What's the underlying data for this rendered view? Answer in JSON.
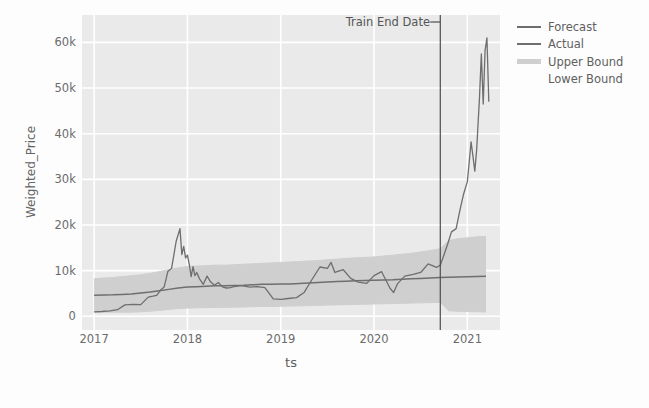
{
  "chart_data": {
    "type": "line",
    "title": "",
    "xlabel": "ts",
    "ylabel": "Weighted_Price",
    "grid": true,
    "legend_position": "right",
    "xlim": [
      2016.87,
      2021.35
    ],
    "ylim": [
      -3000,
      66000
    ],
    "xticks": [
      {
        "label": "2017",
        "value": 2017
      },
      {
        "label": "2018",
        "value": 2018
      },
      {
        "label": "2019",
        "value": 2019
      },
      {
        "label": "2020",
        "value": 2020
      },
      {
        "label": "2021",
        "value": 2021
      }
    ],
    "yticks": [
      {
        "label": "0",
        "value": 0
      },
      {
        "label": "10k",
        "value": 10000
      },
      {
        "label": "20k",
        "value": 20000
      },
      {
        "label": "30k",
        "value": 30000
      },
      {
        "label": "40k",
        "value": 40000
      },
      {
        "label": "50k",
        "value": 50000
      },
      {
        "label": "60k",
        "value": 60000
      }
    ],
    "annotations": [
      {
        "label": "Train End Date",
        "type": "vline",
        "x": 2020.71
      }
    ],
    "legend": [
      {
        "label": "Forecast",
        "color": "#6e6e6e",
        "style": "line"
      },
      {
        "label": "Actual",
        "color": "#6e6e6e",
        "style": "line"
      },
      {
        "label": "Upper Bound",
        "color": "#cfcfcf",
        "style": "band"
      },
      {
        "label": "Lower Bound",
        "color": "#e8e8e8",
        "style": "band"
      }
    ],
    "series": [
      {
        "name": "Actual",
        "color": "#6e6e6e",
        "x": [
          2017.0,
          2017.08,
          2017.17,
          2017.25,
          2017.33,
          2017.42,
          2017.5,
          2017.58,
          2017.63,
          2017.67,
          2017.71,
          2017.75,
          2017.79,
          2017.83,
          2017.88,
          2017.92,
          2017.94,
          2017.96,
          2017.98,
          2018.0,
          2018.02,
          2018.04,
          2018.06,
          2018.08,
          2018.1,
          2018.13,
          2018.17,
          2018.21,
          2018.25,
          2018.29,
          2018.33,
          2018.38,
          2018.42,
          2018.46,
          2018.5,
          2018.58,
          2018.67,
          2018.75,
          2018.83,
          2018.92,
          2019.0,
          2019.08,
          2019.17,
          2019.25,
          2019.33,
          2019.42,
          2019.5,
          2019.54,
          2019.58,
          2019.67,
          2019.75,
          2019.83,
          2019.92,
          2020.0,
          2020.08,
          2020.17,
          2020.21,
          2020.25,
          2020.33,
          2020.42,
          2020.5,
          2020.58,
          2020.67,
          2020.71,
          2020.75,
          2020.79,
          2020.83,
          2020.88,
          2020.92,
          2020.96,
          2021.0,
          2021.02,
          2021.04,
          2021.06,
          2021.08,
          2021.1,
          2021.13,
          2021.15,
          2021.17,
          2021.19,
          2021.21,
          2021.23
        ],
        "y": [
          980,
          1050,
          1200,
          1450,
          2500,
          2600,
          2550,
          4200,
          4400,
          4600,
          5700,
          6400,
          9800,
          10500,
          16500,
          19200,
          13500,
          15300,
          12800,
          13400,
          11300,
          8700,
          10900,
          8900,
          9600,
          8200,
          7000,
          8800,
          7500,
          6800,
          7400,
          6400,
          6200,
          6300,
          6500,
          6700,
          6400,
          6500,
          6300,
          3800,
          3700,
          3900,
          4100,
          5200,
          7900,
          10800,
          10500,
          11800,
          9600,
          10200,
          8300,
          7500,
          7200,
          8900,
          9800,
          6200,
          5200,
          7100,
          8800,
          9200,
          9600,
          11500,
          10700,
          11200,
          13500,
          15900,
          18500,
          19200,
          23200,
          26800,
          29500,
          33800,
          38200,
          35100,
          31800,
          36500,
          47800,
          57500,
          46500,
          58200,
          61000,
          47000
        ]
      },
      {
        "name": "Forecast",
        "color": "#6e6e6e",
        "x": [
          2017.0,
          2017.1,
          2017.2,
          2017.3,
          2017.4,
          2017.5,
          2017.6,
          2017.7,
          2017.8,
          2017.9,
          2018.0,
          2018.1,
          2018.2,
          2018.3,
          2018.4,
          2018.5,
          2018.6,
          2018.7,
          2018.8,
          2018.9,
          2019.0,
          2019.1,
          2019.2,
          2019.3,
          2019.4,
          2019.5,
          2019.6,
          2019.7,
          2019.8,
          2019.9,
          2020.0,
          2020.1,
          2020.2,
          2020.3,
          2020.4,
          2020.5,
          2020.6,
          2020.71,
          2020.8,
          2020.9,
          2021.0,
          2021.1,
          2021.2
        ],
        "y": [
          4600,
          4650,
          4700,
          4800,
          4900,
          5100,
          5300,
          5600,
          5900,
          6200,
          6400,
          6500,
          6600,
          6700,
          6700,
          6750,
          6800,
          6900,
          7000,
          7000,
          7050,
          7100,
          7200,
          7300,
          7400,
          7500,
          7600,
          7700,
          7800,
          7850,
          7900,
          7950,
          8000,
          8100,
          8200,
          8300,
          8400,
          8500,
          8550,
          8600,
          8650,
          8700,
          8750
        ]
      },
      {
        "name": "Upper Bound",
        "color": "#cfcfcf",
        "x": [
          2017.0,
          2017.1,
          2017.2,
          2017.3,
          2017.4,
          2017.5,
          2017.6,
          2017.7,
          2017.8,
          2017.9,
          2018.0,
          2018.1,
          2018.2,
          2018.3,
          2018.4,
          2018.5,
          2018.6,
          2018.7,
          2018.8,
          2018.9,
          2019.0,
          2019.1,
          2019.2,
          2019.3,
          2019.4,
          2019.5,
          2019.6,
          2019.7,
          2019.8,
          2019.9,
          2020.0,
          2020.1,
          2020.2,
          2020.3,
          2020.4,
          2020.5,
          2020.6,
          2020.71,
          2020.8,
          2020.9,
          2021.0,
          2021.1,
          2021.2
        ],
        "y": [
          8200,
          8400,
          8500,
          8700,
          8900,
          9100,
          9400,
          9800,
          10200,
          10600,
          10900,
          11000,
          11100,
          11200,
          11200,
          11300,
          11400,
          11500,
          11600,
          11700,
          11800,
          11900,
          12000,
          12100,
          12200,
          12400,
          12500,
          12700,
          12800,
          12900,
          13000,
          13200,
          13400,
          13600,
          13800,
          14100,
          14400,
          14800,
          16600,
          17000,
          17200,
          17400,
          17500
        ]
      },
      {
        "name": "Lower Bound",
        "color": "#cfcfcf",
        "x": [
          2017.0,
          2017.1,
          2017.2,
          2017.3,
          2017.4,
          2017.5,
          2017.6,
          2017.7,
          2017.8,
          2017.9,
          2018.0,
          2018.1,
          2018.2,
          2018.3,
          2018.4,
          2018.5,
          2018.6,
          2018.7,
          2018.8,
          2018.9,
          2019.0,
          2019.1,
          2019.2,
          2019.3,
          2019.4,
          2019.5,
          2019.6,
          2019.7,
          2019.8,
          2019.9,
          2020.0,
          2020.1,
          2020.2,
          2020.3,
          2020.4,
          2020.5,
          2020.6,
          2020.71,
          2020.8,
          2020.9,
          2021.0,
          2021.1,
          2021.2
        ],
        "y": [
          900,
          900,
          900,
          900,
          900,
          1000,
          1100,
          1300,
          1500,
          1700,
          1800,
          1850,
          1900,
          1950,
          1950,
          2000,
          2050,
          2100,
          2150,
          2150,
          2200,
          2250,
          2300,
          2350,
          2400,
          2450,
          2500,
          2550,
          2600,
          2650,
          2700,
          2750,
          2800,
          2850,
          2900,
          2950,
          3000,
          3050,
          1200,
          1100,
          1050,
          1000,
          950
        ]
      }
    ]
  },
  "axes": {
    "ylabel": "Weighted_Price",
    "xlabel": "ts"
  },
  "annotation": {
    "train_end_label": "Train End Date"
  },
  "style": {
    "plot_background": "#eaeaea",
    "grid_color": "#ffffff",
    "line_color": "#6e6e6e",
    "band_color": "#cfcfcf",
    "vline_color": "#4d4d4d",
    "text_color": "#606060"
  }
}
